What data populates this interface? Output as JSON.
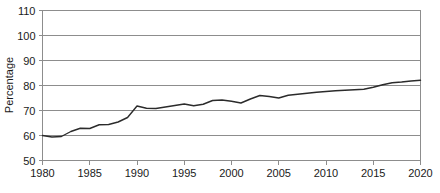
{
  "chart_data": {
    "type": "line",
    "title": "",
    "xlabel": "",
    "ylabel": "Percentage",
    "xlim": [
      1980,
      2020
    ],
    "ylim": [
      50,
      110
    ],
    "ytick_step": 10,
    "xtick_step": 5,
    "yticks": [
      50,
      60,
      70,
      80,
      90,
      100,
      110
    ],
    "xticks": [
      1980,
      1985,
      1990,
      1995,
      2000,
      2005,
      2010,
      2015,
      2020
    ],
    "grid": "horizontal",
    "legend": "none",
    "line_color": "#2b2b2b",
    "grid_color": "#8d8d8d",
    "background_color": "#ffffff",
    "series": [
      {
        "name": "Percentage",
        "x": [
          1980,
          1981,
          1982,
          1983,
          1984,
          1985,
          1986,
          1987,
          1988,
          1989,
          1990,
          1991,
          1992,
          1993,
          1994,
          1995,
          1996,
          1997,
          1998,
          1999,
          2000,
          2001,
          2002,
          2003,
          2004,
          2005,
          2006,
          2007,
          2008,
          2009,
          2010,
          2011,
          2012,
          2013,
          2014,
          2015,
          2016,
          2017,
          2018,
          2019,
          2020
        ],
        "values": [
          60.0,
          59.4,
          59.6,
          61.6,
          62.9,
          62.8,
          64.3,
          64.4,
          65.4,
          67.2,
          71.8,
          70.9,
          70.8,
          71.4,
          72.0,
          72.6,
          71.9,
          72.5,
          74.0,
          74.2,
          73.7,
          73.0,
          74.6,
          76.0,
          75.6,
          75.0,
          76.1,
          76.5,
          76.9,
          77.3,
          77.6,
          77.9,
          78.1,
          78.3,
          78.5,
          79.3,
          80.3,
          81.1,
          81.4,
          81.8,
          82.1
        ]
      }
    ]
  },
  "axis": {
    "y_label": "Percentage"
  }
}
